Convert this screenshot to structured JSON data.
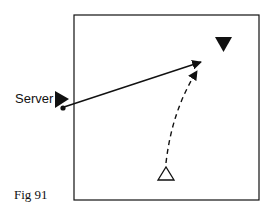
{
  "diagram": {
    "labels": {
      "server": "Server",
      "figure": "Fig 91"
    },
    "colors": {
      "ink": "#111111",
      "background": "#ffffff"
    },
    "elements": [
      {
        "type": "court-boundary",
        "shape": "square"
      },
      {
        "type": "server-marker",
        "shape": "filled-triangle-right"
      },
      {
        "type": "ball",
        "shape": "dot"
      },
      {
        "type": "target-player",
        "shape": "filled-triangle-down"
      },
      {
        "type": "receiver-player",
        "shape": "open-triangle-up"
      },
      {
        "type": "ball-path",
        "style": "solid-arrow"
      },
      {
        "type": "player-movement",
        "style": "dashed-curved-arrow"
      }
    ]
  }
}
